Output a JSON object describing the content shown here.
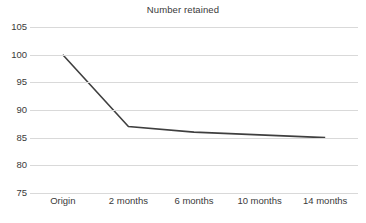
{
  "chart_data": {
    "type": "line",
    "title": "Number retained",
    "xlabel": "",
    "ylabel": "",
    "categories": [
      "Origin",
      "2 months",
      "6 months",
      "10 months",
      "14 months"
    ],
    "series": [
      {
        "name": "Number retained",
        "values": [
          100,
          87,
          86,
          85.5,
          85
        ],
        "color": "#3f3f3f"
      }
    ],
    "ylim": [
      75,
      105
    ],
    "yticks": [
      105,
      100,
      95,
      90,
      85,
      80,
      75
    ],
    "ytick_labels": [
      "105",
      "100",
      "95",
      "90",
      "85",
      "80",
      "75"
    ],
    "grid": true,
    "grid_color": "#d9d9d9",
    "legend": false,
    "legend_position": "none",
    "background": "#ffffff",
    "text_color": "#3a3a3a"
  }
}
